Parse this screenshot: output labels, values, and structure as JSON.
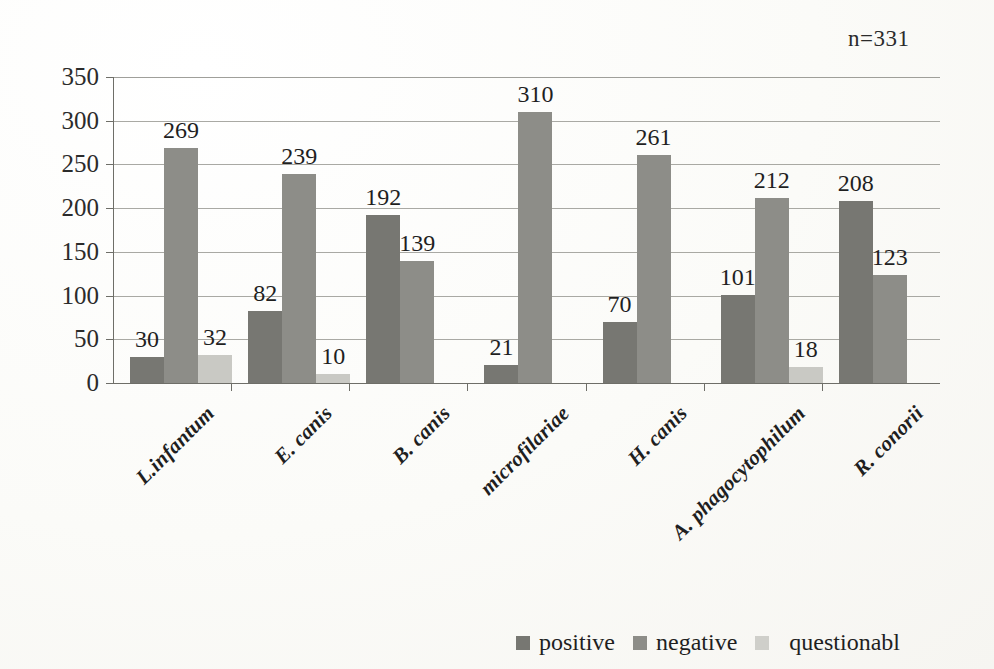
{
  "annotation": {
    "sample_size": "n=331"
  },
  "legend": {
    "items": [
      {
        "label": "positive",
        "color": "#777772",
        "key": "positive"
      },
      {
        "label": "negative",
        "color": "#8d8d88",
        "key": "negative"
      },
      {
        "label": "questionabl",
        "color": "#cfcfca",
        "key": "questionable"
      }
    ]
  },
  "axis": {
    "y_ticks": [
      "350",
      "300",
      "250",
      "200",
      "150",
      "100",
      "50",
      "0"
    ],
    "y_min": 0,
    "y_max": 350
  },
  "chart_data": {
    "type": "bar",
    "title": "",
    "subtitle": "",
    "xlabel": "",
    "ylabel": "",
    "ylim": [
      0,
      350
    ],
    "ytick_step": 50,
    "grid": true,
    "legend_position": "bottom-right",
    "annotation": "n=331",
    "categories": [
      "L.infantum",
      "E. canis",
      "B. canis",
      "microfilariae",
      "H. canis",
      "A. phagocytophilum",
      "R. conorii"
    ],
    "series": [
      {
        "name": "positive",
        "color": "#777772",
        "values": [
          30,
          82,
          192,
          21,
          70,
          101,
          208
        ]
      },
      {
        "name": "negative",
        "color": "#8d8d88",
        "values": [
          269,
          239,
          139,
          310,
          261,
          212,
          123
        ]
      },
      {
        "name": "questionable",
        "color": "#c9c9c4",
        "values": [
          32,
          10,
          0,
          0,
          0,
          18,
          0
        ]
      }
    ],
    "data_labels": {
      "positive": [
        "30",
        "82",
        "192",
        "21",
        "70",
        "101",
        "208"
      ],
      "negative": [
        "269",
        "239",
        "139",
        "310",
        "261",
        "212",
        "123"
      ],
      "questionable": [
        "32",
        "10",
        "",
        "",
        "",
        "18",
        ""
      ]
    }
  }
}
